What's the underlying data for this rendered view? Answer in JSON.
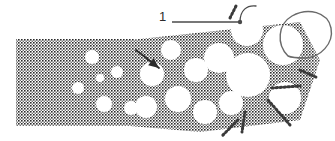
{
  "figure": {
    "type": "halftone-micrograph-illustration",
    "width": 335,
    "height": 141,
    "background_color": "#ffffff",
    "ink_color": "#2b2b2b",
    "line_color": "#555555"
  },
  "callouts": [
    {
      "id": "callout-1",
      "label": "1",
      "label_x": 159,
      "label_y": 10,
      "leader": {
        "x1": 172,
        "y1": 22,
        "x2": 240,
        "y2": 22,
        "width": 1.6,
        "color": "#4a4a4a"
      },
      "terminal_dot": {
        "cx": 240,
        "cy": 22,
        "r": 2.2
      },
      "hook_arc": {
        "path": "M240,22 C240,10 247,5 256,6",
        "color": "#4a4a4a",
        "width": 1.3
      }
    }
  ],
  "annotations": [
    {
      "id": "pore-pointer-arrow",
      "kind": "arrow",
      "from_x": 136,
      "from_y": 50,
      "to_x": 159,
      "to_y": 68,
      "color": "#2b2b2b",
      "width": 1.8,
      "head_size": 6
    }
  ],
  "shapes": {
    "solid_block": {
      "name": "dense-matrix-block",
      "x": 16,
      "y": 39,
      "w": 118,
      "h": 87,
      "fill": "halftone-50"
    },
    "big_loop": {
      "name": "large-cell-outline",
      "path": "M288,56 C276,44 278,24 292,16 C308,7 328,12 331,28 C334,44 320,57 306,58 C298,58 292,58 288,56 Z",
      "stroke": "#6a6a6a",
      "width": 1.4
    }
  },
  "cells": [
    {
      "cx": 92,
      "cy": 57,
      "r": 7
    },
    {
      "cx": 78,
      "cy": 88,
      "r": 6
    },
    {
      "cx": 104,
      "cy": 104,
      "r": 8
    },
    {
      "cx": 117,
      "cy": 72,
      "r": 6
    },
    {
      "cx": 100,
      "cy": 78,
      "r": 4
    },
    {
      "cx": 131,
      "cy": 108,
      "r": 7
    },
    {
      "cx": 152,
      "cy": 74,
      "r": 12
    },
    {
      "cx": 146,
      "cy": 107,
      "r": 11
    },
    {
      "cx": 171,
      "cy": 50,
      "r": 10
    },
    {
      "cx": 178,
      "cy": 99,
      "r": 13
    },
    {
      "cx": 196,
      "cy": 70,
      "r": 12
    },
    {
      "cx": 205,
      "cy": 112,
      "r": 12
    },
    {
      "cx": 219,
      "cy": 58,
      "r": 15
    },
    {
      "cx": 231,
      "cy": 103,
      "r": 12
    },
    {
      "cx": 248,
      "cy": 75,
      "r": 22
    },
    {
      "cx": 247,
      "cy": 30,
      "r": 16
    },
    {
      "cx": 283,
      "cy": 45,
      "r": 20
    },
    {
      "cx": 285,
      "cy": 98,
      "r": 16
    }
  ],
  "struts": [
    {
      "x1": 230,
      "y1": 18,
      "x2": 236,
      "y2": 6
    },
    {
      "x1": 268,
      "y1": 100,
      "x2": 290,
      "y2": 125
    },
    {
      "x1": 245,
      "y1": 112,
      "x2": 242,
      "y2": 132
    },
    {
      "x1": 272,
      "y1": 88,
      "x2": 300,
      "y2": 86
    },
    {
      "x1": 300,
      "y1": 70,
      "x2": 318,
      "y2": 78
    },
    {
      "x1": 238,
      "y1": 120,
      "x2": 222,
      "y2": 136
    }
  ]
}
